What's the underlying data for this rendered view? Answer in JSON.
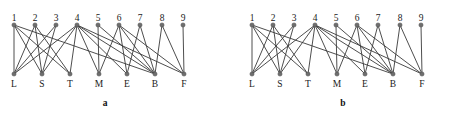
{
  "figure": {
    "width": 475,
    "height": 117,
    "background_color": "#ffffff",
    "node_color": "#6e6e6e",
    "node_stroke_color": "#4a4a4a",
    "edge_color": "#3a3a3a",
    "label_color": "#1a1a1a"
  },
  "chart_data": {
    "type": "diagram",
    "subtype": "bipartite-graph",
    "title": "",
    "panels": [
      {
        "caption": "a",
        "top_nodes": [
          {
            "id": "1",
            "label": "1",
            "x": 14,
            "y": 25
          },
          {
            "id": "2",
            "label": "2",
            "x": 35,
            "y": 25
          },
          {
            "id": "3",
            "label": "3",
            "x": 56,
            "y": 25
          },
          {
            "id": "4",
            "label": "4",
            "x": 77,
            "y": 25
          },
          {
            "id": "5",
            "label": "5",
            "x": 98,
            "y": 25
          },
          {
            "id": "6",
            "label": "6",
            "x": 119,
            "y": 25
          },
          {
            "id": "7",
            "label": "7",
            "x": 140,
            "y": 25
          },
          {
            "id": "8",
            "label": "8",
            "x": 162,
            "y": 25
          },
          {
            "id": "9",
            "label": "9",
            "x": 183,
            "y": 25
          }
        ],
        "bottom_nodes": [
          {
            "id": "L",
            "label": "L",
            "x": 14,
            "y": 74
          },
          {
            "id": "S",
            "label": "S",
            "x": 42,
            "y": 74
          },
          {
            "id": "T",
            "label": "T",
            "x": 70,
            "y": 74
          },
          {
            "id": "M",
            "label": "M",
            "x": 99,
            "y": 74
          },
          {
            "id": "E",
            "label": "E",
            "x": 127,
            "y": 74
          },
          {
            "id": "B",
            "label": "B",
            "x": 155,
            "y": 74
          },
          {
            "id": "F",
            "label": "F",
            "x": 184,
            "y": 74
          }
        ],
        "edges": [
          [
            "1",
            "L"
          ],
          [
            "1",
            "S"
          ],
          [
            "1",
            "T"
          ],
          [
            "1",
            "B"
          ],
          [
            "2",
            "L"
          ],
          [
            "2",
            "S"
          ],
          [
            "2",
            "T"
          ],
          [
            "3",
            "L"
          ],
          [
            "3",
            "S"
          ],
          [
            "4",
            "L"
          ],
          [
            "4",
            "S"
          ],
          [
            "4",
            "T"
          ],
          [
            "4",
            "M"
          ],
          [
            "4",
            "E"
          ],
          [
            "4",
            "B"
          ],
          [
            "4",
            "F"
          ],
          [
            "5",
            "M"
          ],
          [
            "5",
            "B"
          ],
          [
            "6",
            "M"
          ],
          [
            "6",
            "E"
          ],
          [
            "6",
            "B"
          ],
          [
            "6",
            "F"
          ],
          [
            "7",
            "E"
          ],
          [
            "7",
            "B"
          ],
          [
            "8",
            "B"
          ],
          [
            "8",
            "F"
          ],
          [
            "9",
            "F"
          ]
        ]
      },
      {
        "caption": "b",
        "top_nodes": [
          {
            "id": "1",
            "label": "1",
            "x": 14,
            "y": 25
          },
          {
            "id": "2",
            "label": "2",
            "x": 35,
            "y": 25
          },
          {
            "id": "3",
            "label": "3",
            "x": 56,
            "y": 25
          },
          {
            "id": "4",
            "label": "4",
            "x": 77,
            "y": 25
          },
          {
            "id": "5",
            "label": "5",
            "x": 98,
            "y": 25
          },
          {
            "id": "6",
            "label": "6",
            "x": 119,
            "y": 25
          },
          {
            "id": "7",
            "label": "7",
            "x": 140,
            "y": 25
          },
          {
            "id": "8",
            "label": "8",
            "x": 162,
            "y": 25
          },
          {
            "id": "9",
            "label": "9",
            "x": 183,
            "y": 25
          }
        ],
        "bottom_nodes": [
          {
            "id": "L",
            "label": "L",
            "x": 14,
            "y": 74
          },
          {
            "id": "S",
            "label": "S",
            "x": 42,
            "y": 74
          },
          {
            "id": "T",
            "label": "T",
            "x": 70,
            "y": 74
          },
          {
            "id": "M",
            "label": "M",
            "x": 99,
            "y": 74
          },
          {
            "id": "E",
            "label": "E",
            "x": 127,
            "y": 74
          },
          {
            "id": "B",
            "label": "B",
            "x": 155,
            "y": 74
          },
          {
            "id": "F",
            "label": "F",
            "x": 184,
            "y": 74
          }
        ],
        "edges": [
          [
            "1",
            "L"
          ],
          [
            "1",
            "S"
          ],
          [
            "1",
            "T"
          ],
          [
            "1",
            "B"
          ],
          [
            "2",
            "L"
          ],
          [
            "2",
            "S"
          ],
          [
            "2",
            "T"
          ],
          [
            "3",
            "L"
          ],
          [
            "3",
            "S"
          ],
          [
            "4",
            "L"
          ],
          [
            "4",
            "S"
          ],
          [
            "4",
            "T"
          ],
          [
            "4",
            "M"
          ],
          [
            "4",
            "E"
          ],
          [
            "4",
            "B"
          ],
          [
            "4",
            "F"
          ],
          [
            "5",
            "M"
          ],
          [
            "5",
            "B"
          ],
          [
            "6",
            "M"
          ],
          [
            "6",
            "E"
          ],
          [
            "6",
            "B"
          ],
          [
            "6",
            "F"
          ],
          [
            "7",
            "E"
          ],
          [
            "7",
            "B"
          ],
          [
            "8",
            "B"
          ],
          [
            "8",
            "F"
          ],
          [
            "9",
            "F"
          ]
        ]
      }
    ]
  }
}
